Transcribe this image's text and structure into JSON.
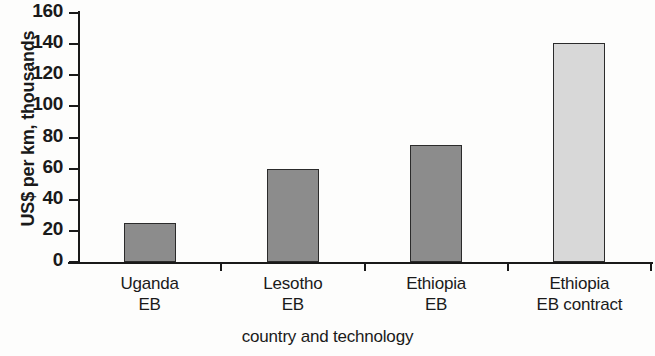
{
  "chart_data": {
    "type": "bar",
    "title": "",
    "subtitle": "",
    "xlabel": "country and technology",
    "ylabel": "US$ per km, thousands",
    "categories": [
      "Uganda\nEB",
      "Lesotho\nEB",
      "Ethiopia\nEB",
      "Ethiopia\nEB contract"
    ],
    "category_lines": [
      {
        "line1": "Uganda",
        "line2": "EB"
      },
      {
        "line1": "Lesotho",
        "line2": "EB"
      },
      {
        "line1": "Ethiopia",
        "line2": "EB"
      },
      {
        "line1": "Ethiopia",
        "line2": "EB contract"
      }
    ],
    "values": [
      25,
      60,
      75,
      141
    ],
    "bar_colors": [
      "#8c8c8c",
      "#8c8c8c",
      "#8c8c8c",
      "#d8d8d8"
    ],
    "ylim": [
      0,
      160
    ],
    "yticks": [
      0,
      20,
      40,
      60,
      80,
      100,
      120,
      140,
      160
    ],
    "ytick_labels": [
      "0",
      "20",
      "40",
      "60",
      "80",
      "100",
      "120",
      "140",
      "160"
    ],
    "grid": false,
    "legend": null,
    "legend_position": "none",
    "annotations": []
  },
  "colors": {
    "bar_dark": "#8c8c8c",
    "bar_light": "#d8d8d8",
    "axis": "#191919",
    "text": "#1a1a1a",
    "background": "#fdfdfc"
  }
}
